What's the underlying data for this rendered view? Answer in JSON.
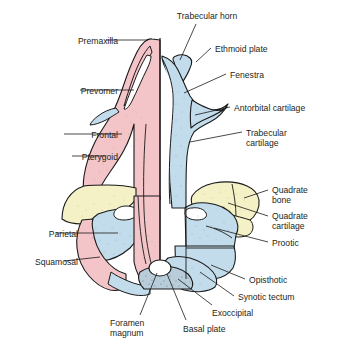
{
  "figure": {
    "kind": "anatomical-diagram",
    "colors": {
      "bone_pink": "#f3c4c8",
      "cartilage_blue": "#c3dcec",
      "quadrate_yellow": "#f4f1c6",
      "outline": "#1a1a1a",
      "leader_line": "#1a1a1a",
      "background": "#ffffff",
      "text": "#231f20"
    }
  },
  "labels": [
    {
      "id": "trabecular-horn",
      "text": "Trabecular horn",
      "align": "center",
      "x": 162,
      "y": 11,
      "w": 90
    },
    {
      "id": "premaxilla",
      "text": "Premaxilla",
      "align": "right",
      "x": 8,
      "y": 36,
      "w": 110
    },
    {
      "id": "ethmoid-plate",
      "text": "Ethmoid plate",
      "align": "left",
      "x": 215,
      "y": 44,
      "w": 110
    },
    {
      "id": "fenestra",
      "text": "Fenestra",
      "align": "left",
      "x": 230,
      "y": 70,
      "w": 100
    },
    {
      "id": "prevomer",
      "text": "Prevomer",
      "align": "right",
      "x": 8,
      "y": 86,
      "w": 110
    },
    {
      "id": "antorbital-cartilage",
      "text": "Antorbital cartilage",
      "align": "left",
      "x": 234,
      "y": 103,
      "w": 105
    },
    {
      "id": "frontal",
      "text": "Frontal",
      "align": "right",
      "x": 8,
      "y": 130,
      "w": 110
    },
    {
      "id": "trabecular-cartilage",
      "text": "Trabecular\ncartilage",
      "align": "left",
      "x": 246,
      "y": 128,
      "w": 92
    },
    {
      "id": "pterygoid",
      "text": "Pterygoid",
      "align": "right",
      "x": 8,
      "y": 152,
      "w": 110
    },
    {
      "id": "quadrate-bone",
      "text": "Quadrate\nbone",
      "align": "left",
      "x": 272,
      "y": 185,
      "w": 66
    },
    {
      "id": "quadrate-cartilage",
      "text": "Quadrate\ncartilage",
      "align": "left",
      "x": 272,
      "y": 211,
      "w": 66
    },
    {
      "id": "parietal",
      "text": "Parietal",
      "align": "right",
      "x": 8,
      "y": 229,
      "w": 70
    },
    {
      "id": "prootic",
      "text": "Prootic",
      "align": "left",
      "x": 272,
      "y": 238,
      "w": 66
    },
    {
      "id": "squamosal",
      "text": "Squamosal",
      "align": "right",
      "x": 8,
      "y": 257,
      "w": 70
    },
    {
      "id": "opisthotic",
      "text": "Opisthotic",
      "align": "left",
      "x": 249,
      "y": 275,
      "w": 88
    },
    {
      "id": "synotic-tectum",
      "text": "Synotic tectum",
      "align": "left",
      "x": 238,
      "y": 292,
      "w": 100
    },
    {
      "id": "exoccipital",
      "text": "Exoccipital",
      "align": "left",
      "x": 212,
      "y": 308,
      "w": 84
    },
    {
      "id": "foramen-magnum",
      "text": "Foramen\nmagnum",
      "align": "left",
      "x": 110,
      "y": 318,
      "w": 64
    },
    {
      "id": "basal-plate",
      "text": "Basal plate",
      "align": "left",
      "x": 183,
      "y": 324,
      "w": 78
    }
  ],
  "leaders": [
    {
      "id": "trabecular-horn",
      "path": "M 196 24 L 180 60"
    },
    {
      "id": "premaxilla",
      "path": "M 106 40 L 148 40"
    },
    {
      "id": "ethmoid-plate",
      "path": "M 211 48 L 196 62"
    },
    {
      "id": "fenestra",
      "path": "M 226 74 L 184 93"
    },
    {
      "id": "prevomer",
      "path": "M 80 90 L 134 90"
    },
    {
      "id": "antorbital-cartilage",
      "path": "M 230 107 L 195 115"
    },
    {
      "id": "frontal",
      "path": "M 64 134 L 122 134"
    },
    {
      "id": "trabecular-cartilage",
      "path": "M 242 132 L 190 142"
    },
    {
      "id": "pterygoid",
      "path": "M 72 156 L 105 156"
    },
    {
      "id": "quadrate-bone",
      "path": "M 268 190 L 244 198"
    },
    {
      "id": "quadrate-cartilage",
      "path": "M 268 216 L 228 203"
    },
    {
      "id": "parietal",
      "path": "M 56 233 L 118 233"
    },
    {
      "id": "prootic",
      "path": "M 268 242 L 214 228"
    },
    {
      "id": "squamosal",
      "path": "M 64 261 L 100 257"
    },
    {
      "id": "opisthotic",
      "path": "M 245 279 L 211 265"
    },
    {
      "id": "synotic-tectum",
      "path": "M 234 296 L 200 272"
    },
    {
      "id": "exoccipital",
      "path": "M 212 305 L 178 279"
    },
    {
      "id": "foramen-magnum",
      "path": "M 140 315 L 157 273"
    },
    {
      "id": "basal-plate",
      "path": "M 186 320 L 167 274"
    }
  ]
}
